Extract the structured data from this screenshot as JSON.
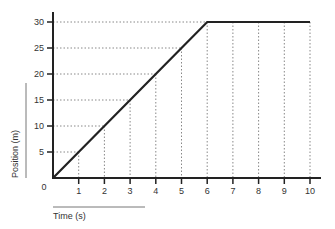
{
  "chart_data": {
    "type": "line",
    "title": "",
    "xlabel": "Time (s)",
    "ylabel": "Position (m)",
    "x": [
      0,
      1,
      2,
      3,
      4,
      5,
      6,
      7,
      8,
      9,
      10
    ],
    "series": [
      {
        "name": "Position",
        "values": [
          0,
          5,
          10,
          15,
          20,
          25,
          30,
          30,
          30,
          30,
          30
        ]
      }
    ],
    "xlim": [
      0,
      10
    ],
    "ylim": [
      0,
      30
    ],
    "xticks": [
      "1",
      "2",
      "3",
      "4",
      "5",
      "6",
      "7",
      "8",
      "9",
      "10"
    ],
    "yticks": [
      "5",
      "10",
      "15",
      "20",
      "25",
      "30"
    ],
    "origin_label": "0",
    "grid": "dotted drop lines from data points to axes",
    "legend": "none"
  },
  "colors": {
    "line": "#222222",
    "axis": "#222222",
    "grid": "#888888",
    "text": "#333333"
  }
}
